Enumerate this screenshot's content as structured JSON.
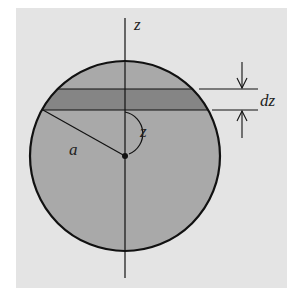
{
  "figure": {
    "type": "sphere-slice-diagram",
    "colors": {
      "page": "#ffffff",
      "panel": "#e4e4e4",
      "sphere_fill": "#a9a9a9",
      "band_fill": "#858585",
      "stroke": "#111111"
    },
    "labels": {
      "axis": "z",
      "angle": "z",
      "radius": "a",
      "thickness": "dz"
    }
  }
}
